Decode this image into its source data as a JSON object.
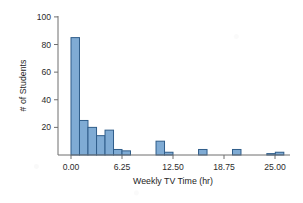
{
  "chart_data": {
    "type": "bar",
    "title": "",
    "subtitle": "",
    "xlabel": "Weekly TV Time (hr)",
    "ylabel": "# of Students",
    "xlim": [
      -1.6,
      27.2
    ],
    "ylim": [
      0,
      104
    ],
    "grid": false,
    "legend": null,
    "bar_fill_color": "#7FABD4",
    "bar_edge_color": "#2F5D8A",
    "axis_color": "#6F6F6F",
    "text_color": "#2B2B2B",
    "bin_width": 1.04,
    "xticks": [
      0,
      6.25,
      12.5,
      18.75,
      25
    ],
    "xtick_labels": [
      "0.00",
      "6.25",
      "12.50",
      "18.75",
      "25.00"
    ],
    "yticks": [
      20,
      40,
      60,
      80,
      100
    ],
    "ytick_labels": [
      "20",
      "40",
      "60",
      "80",
      "100"
    ],
    "bins": [
      {
        "start": 0.0,
        "end": 1.04,
        "count": 85
      },
      {
        "start": 1.04,
        "end": 2.08,
        "count": 25
      },
      {
        "start": 2.08,
        "end": 3.13,
        "count": 20
      },
      {
        "start": 3.13,
        "end": 4.17,
        "count": 14
      },
      {
        "start": 4.17,
        "end": 5.21,
        "count": 18
      },
      {
        "start": 5.21,
        "end": 6.25,
        "count": 4
      },
      {
        "start": 6.25,
        "end": 7.29,
        "count": 3
      },
      {
        "start": 10.42,
        "end": 11.46,
        "count": 10
      },
      {
        "start": 11.46,
        "end": 12.5,
        "count": 2
      },
      {
        "start": 15.63,
        "end": 16.67,
        "count": 4
      },
      {
        "start": 19.79,
        "end": 20.83,
        "count": 4
      },
      {
        "start": 24.0,
        "end": 25.04,
        "count": 1
      },
      {
        "start": 25.04,
        "end": 26.08,
        "count": 2
      }
    ],
    "x": [
      0.0,
      1.04,
      2.08,
      3.13,
      4.17,
      5.21,
      6.25,
      10.42,
      11.46,
      15.63,
      19.79,
      24.0,
      25.04
    ],
    "values": [
      85,
      25,
      20,
      14,
      18,
      4,
      3,
      10,
      2,
      4,
      4,
      1,
      2
    ],
    "categories": [
      "0.00-1.04",
      "1.04-2.08",
      "2.08-3.13",
      "3.13-4.17",
      "4.17-5.21",
      "5.21-6.25",
      "6.25-7.29",
      "10.42-11.46",
      "11.46-12.50",
      "15.63-16.67",
      "19.79-20.83",
      "24.00-25.04",
      "25.04-26.08"
    ]
  }
}
